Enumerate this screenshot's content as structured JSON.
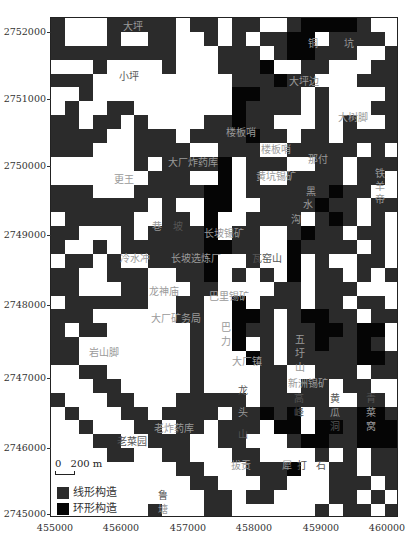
{
  "map": {
    "grid_cols": 25,
    "grid_rows": 36,
    "legend_codes": {
      ".": "empty",
      "L": "线形构造",
      "R": "环形构造"
    },
    "grid": [
      "LWWWLLLLLWLLWLLWWLRRRRLWW",
      "LWWWLWWLLWWLWLWLLRRWLLLLW",
      "LLLLLLLLLWWWLLLWLRRLLLWWL",
      "WWWLWWWWLWWWLLLRWWLLWWWLL",
      "LLLWWWWWWWWWWLLLRLLWWWLLL",
      "WWLWWWWWWWWWWRRLLLWLWWWWL",
      "WLWWLLWWWWWWWRLLLLWLWWWLL",
      "LLWLLWLWWWWLLRLLWWWLWLWWL",
      "LLLLWWLLLWLLLLRLLWLLWLLLL",
      "LLLWWWLLLLWWLLLWWLLLLLWLW",
      "WWWWWWLWLLLLRWLLLWWLLWLLL",
      "WWWWWWWLLLWWRWLWWLLLLWLLW",
      "LLLWWWLLLLLRRWLLLLLLRLLWW",
      "LLLLLLLWLWWRRWWLLLLRLLWLL",
      "WLLLLLWWLLWRWWLLLLWLRLWLW",
      "LLWWWLWLLLLRWLLWWLRLLWLLW",
      "LWWLWLLLLLLRRLLWWRLLLLWLW",
      "WLLWLWWLLLLRWWLWWRWLWWLLW",
      "LLWWLLLWWLLRWLWLWRWLLWLWL",
      "LLWWWLLWWWLLWWWWLLWLLLWWW",
      "WLLLLLLWWLLWWRWLLLWLLWLLW",
      "LLLWWWWWWLLWWRRLWLRRLLWLL",
      "LWLLWWWWWWLWWRLLWLLRRLRRW",
      "LLWWWWWWWWLWWRWLWLLRLLRLW",
      "LLWWWWWWWWLWWWRLWLLLLLRRL",
      "WWLLWWWWWWLWWWWLLWWLLLWLL",
      "WWWLLWWWWWLWWWWLLWLLWLLWW",
      "LWWWLLWWWLLLLLWLLLLLWWLLW",
      "WLWWWLLWLLLLWLLRLRWLLLRRL",
      "WWLWWWLLWLLWLLLWRRWRRLRRR",
      "WWWLLWWLLLWWLLWWWLRRLLRRR",
      "WWWWLLWWLLWWWLLWWWWLWLWLL",
      "WWWWWWWWWLLWWWLLLRWWLLWLL",
      "WWWWWWWWWWLLWWWLLWWWLLLWL",
      "WWWWWWWWWWWLLWLLWWWWLLWLW",
      "WWWWWWWLWWWLLWWWWWWLWLLWL"
    ],
    "place_labels": [
      {
        "text": "大坪",
        "x": 72,
        "y": 3,
        "tone": "light"
      },
      {
        "text": "小坪",
        "x": 68,
        "y": 53,
        "tone": "dark"
      },
      {
        "text": "铜",
        "x": 257,
        "y": 20,
        "tone": "light"
      },
      {
        "text": "坑",
        "x": 293,
        "y": 20,
        "tone": "light"
      },
      {
        "text": "大坪边",
        "x": 238,
        "y": 58,
        "tone": "light"
      },
      {
        "text": "大树脚",
        "x": 287,
        "y": 94,
        "tone": "light"
      },
      {
        "text": "楼板哨",
        "x": 175,
        "y": 109,
        "tone": "light"
      },
      {
        "text": "楼板哨",
        "x": 210,
        "y": 126,
        "tone": "light"
      },
      {
        "text": "那付",
        "x": 257,
        "y": 136,
        "tone": "light"
      },
      {
        "text": "大厂炸药库",
        "x": 117,
        "y": 139,
        "tone": "light"
      },
      {
        "text": "更王",
        "x": 63,
        "y": 156,
        "tone": "light"
      },
      {
        "text": "黄坑锡矿",
        "x": 205,
        "y": 153,
        "tone": "light"
      },
      {
        "text": "黑",
        "x": 255,
        "y": 168,
        "tone": "light"
      },
      {
        "text": "水",
        "x": 252,
        "y": 181,
        "tone": "light"
      },
      {
        "text": "沟",
        "x": 240,
        "y": 196,
        "tone": "light"
      },
      {
        "text": "铁",
        "x": 324,
        "y": 150,
        "tone": "light"
      },
      {
        "text": "羊",
        "x": 324,
        "y": 163,
        "tone": "light"
      },
      {
        "text": "帝",
        "x": 324,
        "y": 176,
        "tone": "light"
      },
      {
        "text": "巷",
        "x": 101,
        "y": 203,
        "tone": "light"
      },
      {
        "text": "坡",
        "x": 122,
        "y": 203,
        "tone": "dark"
      },
      {
        "text": "长坡锡矿",
        "x": 153,
        "y": 210,
        "tone": "light"
      },
      {
        "text": "冷水冲",
        "x": 69,
        "y": 235,
        "tone": "light"
      },
      {
        "text": "长坡选炼厂",
        "x": 120,
        "y": 235,
        "tone": "light"
      },
      {
        "text": "瓦窑山",
        "x": 201,
        "y": 235,
        "tone": "dark"
      },
      {
        "text": "龙神庙",
        "x": 98,
        "y": 268,
        "tone": "light"
      },
      {
        "text": "巴里锡矿",
        "x": 158,
        "y": 273,
        "tone": "light"
      },
      {
        "text": "大厂矿务局",
        "x": 100,
        "y": 295,
        "tone": "light"
      },
      {
        "text": "巴",
        "x": 170,
        "y": 304,
        "tone": "light"
      },
      {
        "text": "力",
        "x": 170,
        "y": 318,
        "tone": "light"
      },
      {
        "text": "五",
        "x": 244,
        "y": 316,
        "tone": "light"
      },
      {
        "text": "圩",
        "x": 244,
        "y": 330,
        "tone": "light"
      },
      {
        "text": "山",
        "x": 244,
        "y": 344,
        "tone": "light"
      },
      {
        "text": "大厂镇",
        "x": 181,
        "y": 338,
        "tone": "light"
      },
      {
        "text": "岩山脚",
        "x": 38,
        "y": 329,
        "tone": "light"
      },
      {
        "text": "新洲锡矿",
        "x": 237,
        "y": 360,
        "tone": "light"
      },
      {
        "text": "龙",
        "x": 187,
        "y": 367,
        "tone": "dark"
      },
      {
        "text": "头",
        "x": 187,
        "y": 389,
        "tone": "light"
      },
      {
        "text": "山",
        "x": 187,
        "y": 411,
        "tone": "dark"
      },
      {
        "text": "高",
        "x": 243,
        "y": 375,
        "tone": "dark"
      },
      {
        "text": "峰",
        "x": 243,
        "y": 389,
        "tone": "dark"
      },
      {
        "text": "黄",
        "x": 279,
        "y": 375,
        "tone": "dark"
      },
      {
        "text": "瓜",
        "x": 279,
        "y": 389,
        "tone": "light"
      },
      {
        "text": "洞",
        "x": 279,
        "y": 403,
        "tone": "dark"
      },
      {
        "text": "青",
        "x": 315,
        "y": 375,
        "tone": "dark"
      },
      {
        "text": "菜",
        "x": 315,
        "y": 389,
        "tone": "light"
      },
      {
        "text": "窝",
        "x": 315,
        "y": 403,
        "tone": "light"
      },
      {
        "text": "老炸药库",
        "x": 103,
        "y": 405,
        "tone": "light"
      },
      {
        "text": "老菜园",
        "x": 66,
        "y": 418,
        "tone": "dark"
      },
      {
        "text": "拔贡",
        "x": 180,
        "y": 442,
        "tone": "light"
      },
      {
        "text": "犀",
        "x": 231,
        "y": 442,
        "tone": "light"
      },
      {
        "text": "打",
        "x": 246,
        "y": 442,
        "tone": "dark"
      },
      {
        "text": "石",
        "x": 265,
        "y": 442,
        "tone": "dark"
      },
      {
        "text": "鲁",
        "x": 107,
        "y": 472,
        "tone": "dark"
      },
      {
        "text": "塘",
        "x": 107,
        "y": 486,
        "tone": "light"
      }
    ]
  },
  "axes": {
    "y_ticks": [
      {
        "label": "2752000",
        "y": 32
      },
      {
        "label": "2751000",
        "y": 99
      },
      {
        "label": "2750000",
        "y": 166
      },
      {
        "label": "2749000",
        "y": 235
      },
      {
        "label": "2748000",
        "y": 305
      },
      {
        "label": "2747000",
        "y": 378
      },
      {
        "label": "2746000",
        "y": 448
      },
      {
        "label": "2745000",
        "y": 514
      }
    ],
    "x_ticks": [
      {
        "label": "455000",
        "x": 55
      },
      {
        "label": "456000",
        "x": 121
      },
      {
        "label": "457000",
        "x": 188
      },
      {
        "label": "458000",
        "x": 254
      },
      {
        "label": "459000",
        "x": 321
      },
      {
        "label": "460000",
        "x": 387
      }
    ]
  },
  "scale_bar": {
    "zero": "0",
    "label": "200 m"
  },
  "legend": [
    {
      "label": "线形构造",
      "color": "#2b2b2b"
    },
    {
      "label": "环形构造",
      "color": "#050505"
    }
  ]
}
